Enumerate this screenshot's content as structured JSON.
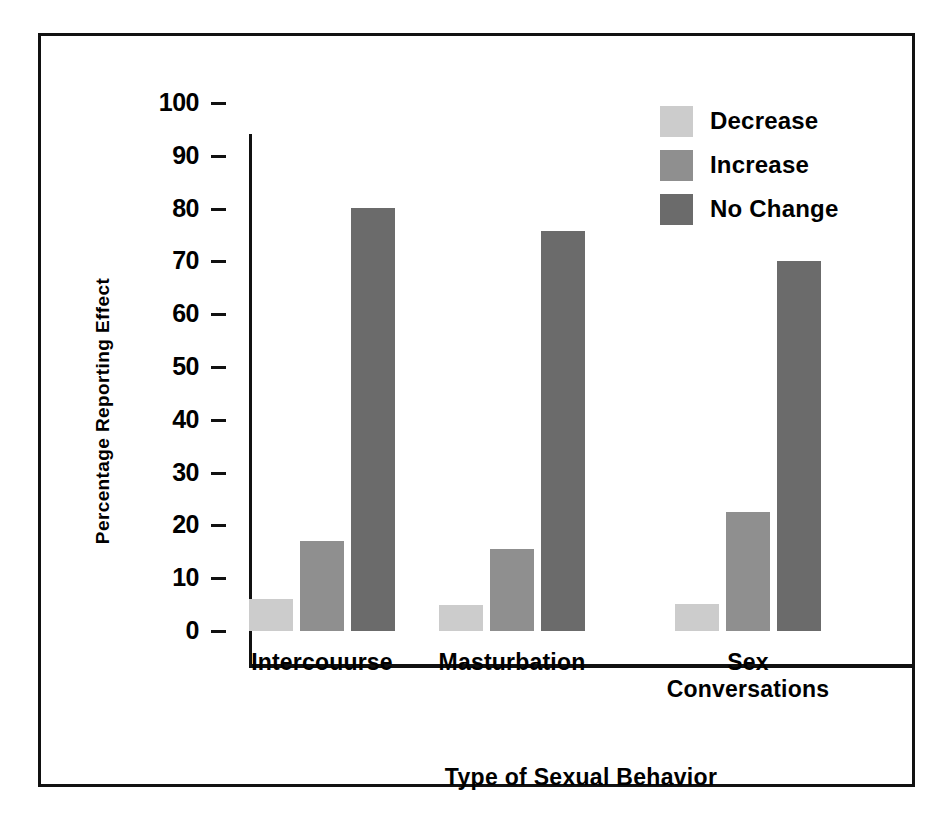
{
  "chart_data": {
    "type": "bar",
    "title": "",
    "xlabel": "Type of Sexual Behavior",
    "ylabel": "Percentage Reporting Effect",
    "categories": [
      "Intercouurse",
      "Masturbation",
      "Sex\nConversations"
    ],
    "series": [
      {
        "name": "Decrease",
        "color": "#cccccc",
        "values": [
          6.1,
          5.0,
          5.2
        ]
      },
      {
        "name": "Increase",
        "color": "#8f8f8f",
        "values": [
          17.1,
          15.6,
          22.5
        ]
      },
      {
        "name": "No Change",
        "color": "#6b6b6b",
        "values": [
          80.2,
          75.7,
          70.0
        ]
      }
    ],
    "ylim": [
      0,
      100
    ],
    "ytick_labels": [
      "100",
      "90",
      "80",
      "70",
      "60",
      "50",
      "40",
      "30",
      "20",
      "10",
      "0"
    ],
    "ytick_values": [
      100,
      90,
      80,
      70,
      60,
      50,
      40,
      30,
      20,
      10,
      0
    ],
    "grid": false,
    "legend_position": "top-right"
  },
  "legend": {
    "items": [
      {
        "label": "Decrease",
        "color": "#cccccc"
      },
      {
        "label": "Increase",
        "color": "#8f8f8f"
      },
      {
        "label": "No Change",
        "color": "#6b6b6b"
      }
    ]
  },
  "colors": {
    "decrease": "#cccccc",
    "increase": "#8f8f8f",
    "no_change": "#6b6b6b",
    "axis": "#111111",
    "background": "#ffffff"
  }
}
